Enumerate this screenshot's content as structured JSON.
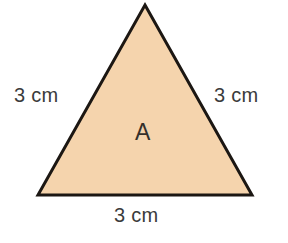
{
  "figure": {
    "type": "equilateral-triangle-diagram",
    "background_color": "#ffffff"
  },
  "shape": {
    "name": "triangle",
    "interior_label": "A",
    "fill_color": "#f5d4ad",
    "stroke_color": "#1c1713",
    "stroke_width": 3,
    "vertices": {
      "apex": {
        "x": 145,
        "y": 5
      },
      "bottom_left": {
        "x": 38,
        "y": 195
      },
      "bottom_right": {
        "x": 252,
        "y": 195
      }
    }
  },
  "labels": {
    "left_side": "3 cm",
    "right_side": "3 cm",
    "bottom_side": "3 cm",
    "interior": "A",
    "text_color": "#3b3b3b",
    "interior_text_color": "#35302b"
  }
}
